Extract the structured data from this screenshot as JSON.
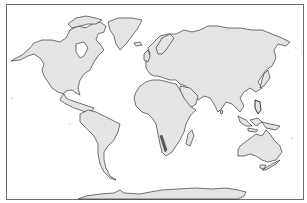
{
  "map": {
    "type": "world-outline",
    "projection": "equirectangular-like",
    "colors": {
      "background": "#ffffff",
      "land_fill": "#e4e4e4",
      "coastline": "#1a1a1a",
      "frame": "#6e6e6e",
      "highlight": "#5a5a5a"
    },
    "highlighted_regions": [
      {
        "name": "Southwest African coast (Namib)"
      }
    ],
    "continents": [
      "North America",
      "Greenland",
      "South America",
      "Europe",
      "Asia",
      "Africa",
      "Madagascar",
      "Australia",
      "New Zealand",
      "Antarctica"
    ]
  }
}
